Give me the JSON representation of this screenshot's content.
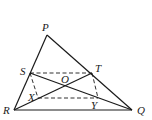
{
  "diagram": {
    "type": "geometry",
    "points": {
      "P": {
        "label": "P",
        "x": 47,
        "y": 35,
        "lx": 42,
        "ly": 31
      },
      "Q": {
        "label": "Q",
        "x": 132,
        "y": 110,
        "lx": 137,
        "ly": 114
      },
      "R": {
        "label": "R",
        "x": 14,
        "y": 110,
        "lx": 3,
        "ly": 114
      },
      "S": {
        "label": "S",
        "x": 30,
        "y": 73,
        "lx": 20,
        "ly": 75
      },
      "T": {
        "label": "T",
        "x": 92,
        "y": 73,
        "lx": 95,
        "ly": 72
      },
      "O": {
        "label": "O",
        "x": 66,
        "y": 86,
        "lx": 61,
        "ly": 83
      },
      "X": {
        "label": "X",
        "x": 38,
        "y": 98,
        "lx": 28,
        "ly": 101
      },
      "Y": {
        "label": "Y",
        "x": 98,
        "y": 98,
        "lx": 91,
        "ly": 109
      }
    },
    "solid_segments": [
      [
        "P",
        "R"
      ],
      [
        "P",
        "Q"
      ],
      [
        "R",
        "Q"
      ],
      [
        "S",
        "Q"
      ],
      [
        "R",
        "T"
      ]
    ],
    "dashed_segments": [
      [
        "S",
        "T"
      ],
      [
        "X",
        "Y"
      ],
      [
        "S",
        "X"
      ],
      [
        "T",
        "Y"
      ]
    ],
    "stroke_color": "#1a1a1a"
  }
}
